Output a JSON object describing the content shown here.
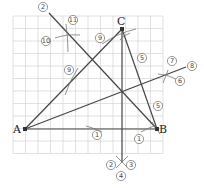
{
  "diagram": {
    "points": {
      "A": {
        "label": "A",
        "x": 25,
        "y": 129
      },
      "B": {
        "label": "B",
        "x": 157,
        "y": 129
      },
      "C": {
        "label": "C",
        "x": 122,
        "y": 29
      }
    },
    "step_labels": [
      {
        "id": "s1a",
        "text": "1",
        "x": 97,
        "y": 135
      },
      {
        "id": "s1b",
        "text": "1",
        "x": 139,
        "y": 139
      },
      {
        "id": "s2a",
        "text": "2",
        "x": 43,
        "y": 7
      },
      {
        "id": "s2b",
        "text": "2",
        "x": 111,
        "y": 165
      },
      {
        "id": "s3",
        "text": "3",
        "x": 131,
        "y": 165
      },
      {
        "id": "s4",
        "text": "4",
        "x": 121,
        "y": 176
      },
      {
        "id": "s5a",
        "text": "5",
        "x": 142,
        "y": 58
      },
      {
        "id": "s5b",
        "text": "5",
        "x": 158,
        "y": 106
      },
      {
        "id": "s6",
        "text": "6",
        "x": 180,
        "y": 81
      },
      {
        "id": "s7",
        "text": "7",
        "x": 172,
        "y": 61
      },
      {
        "id": "s8",
        "text": "8",
        "x": 192,
        "y": 66
      },
      {
        "id": "s9a",
        "text": "9",
        "x": 100,
        "y": 38
      },
      {
        "id": "s9b",
        "text": "9",
        "x": 69,
        "y": 70
      },
      {
        "id": "s10",
        "text": "10",
        "x": 46,
        "y": 41
      },
      {
        "id": "s11",
        "text": "11",
        "x": 73,
        "y": 20
      }
    ]
  }
}
